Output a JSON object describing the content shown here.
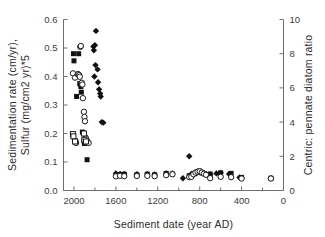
{
  "chart_data": {
    "type": "scatter",
    "title": "",
    "xlabel": "Sediment date (year AD)",
    "ylabel_left": "Sedimentation rate (cm/yr),\nSulfur (mg/cm2 yr)*5",
    "ylabel_left_line1": "Sedimentation rate (cm/yr),",
    "ylabel_left_line2_a": "Sulfur (mg/cm",
    "ylabel_left_line2_sup": "2",
    "ylabel_left_line2_b": " yr)*5",
    "ylabel_right": "Centric: pennate diatom ratio",
    "xlim": [
      2100,
      0
    ],
    "x_reversed": true,
    "ylim_left": [
      0.0,
      0.6
    ],
    "ylim_right": [
      0,
      10
    ],
    "grid": false,
    "legend_position": "none",
    "xticks": [
      2000,
      1600,
      1200,
      800,
      400,
      0
    ],
    "xticklabels": [
      "2000",
      "1600",
      "1200",
      "800",
      "400",
      "0"
    ],
    "xminorticks": [
      1800,
      1400,
      1000,
      600,
      200
    ],
    "yticks_left": [
      0.0,
      0.1,
      0.2,
      0.3,
      0.4,
      0.5,
      0.6
    ],
    "yticklabels_left": [
      "0.0",
      "0.1",
      "0.2",
      "0.3",
      "0.4",
      "0.5",
      "0.6"
    ],
    "yticks_right": [
      0,
      2,
      4,
      6,
      8,
      10
    ],
    "yticklabels_right": [
      "0",
      "2",
      "4",
      "6",
      "8",
      "10"
    ],
    "series": [
      {
        "name": "Sedimentation rate",
        "marker": "filled-square",
        "color": "#111111",
        "axis": "left",
        "points": [
          [
            2005,
            0.48
          ],
          [
            2000,
            0.455
          ],
          [
            1975,
            0.33
          ],
          [
            1955,
            0.48
          ],
          [
            1945,
            0.375
          ],
          [
            1935,
            0.365
          ],
          [
            1930,
            0.345
          ],
          [
            1920,
            0.205
          ],
          [
            1905,
            0.175
          ],
          [
            1900,
            0.165
          ],
          [
            1890,
            0.185
          ],
          [
            1875,
            0.108
          ],
          [
            1560,
            0.056
          ],
          [
            1520,
            0.057
          ],
          [
            1400,
            0.055
          ],
          [
            1300,
            0.057
          ],
          [
            1230,
            0.055
          ],
          [
            1120,
            0.06
          ],
          [
            1060,
            0.058
          ],
          [
            900,
            0.052
          ],
          [
            870,
            0.055
          ],
          [
            840,
            0.063
          ],
          [
            820,
            0.066
          ],
          [
            800,
            0.068
          ],
          [
            780,
            0.062
          ],
          [
            740,
            0.056
          ],
          [
            700,
            0.058
          ],
          [
            600,
            0.062
          ],
          [
            500,
            0.06
          ],
          [
            400,
            0.046
          ],
          [
            120,
            0.043
          ]
        ]
      },
      {
        "name": "Sulfur (mg/cm2 yr)*5",
        "marker": "filled-diamond",
        "color": "#111111",
        "axis": "left",
        "points": [
          [
            1790,
            0.56
          ],
          [
            1800,
            0.51
          ],
          [
            1815,
            0.505
          ],
          [
            1810,
            0.492
          ],
          [
            1795,
            0.44
          ],
          [
            1805,
            0.4
          ],
          [
            1775,
            0.425
          ],
          [
            1770,
            0.38
          ],
          [
            1760,
            0.355
          ],
          [
            1750,
            0.34
          ],
          [
            1745,
            0.33
          ],
          [
            1735,
            0.24
          ],
          [
            1720,
            0.238
          ],
          [
            1600,
            0.06
          ],
          [
            1560,
            0.058
          ],
          [
            1520,
            0.058
          ],
          [
            1400,
            0.057
          ],
          [
            1300,
            0.058
          ],
          [
            1230,
            0.056
          ],
          [
            1120,
            0.06
          ],
          [
            1060,
            0.06
          ],
          [
            960,
            0.043
          ],
          [
            900,
            0.12
          ],
          [
            880,
            0.058
          ],
          [
            860,
            0.06
          ],
          [
            830,
            0.06
          ],
          [
            800,
            0.066
          ],
          [
            780,
            0.064
          ],
          [
            760,
            0.062
          ],
          [
            740,
            0.058
          ],
          [
            700,
            0.056
          ],
          [
            640,
            0.06
          ],
          [
            600,
            0.062
          ],
          [
            520,
            0.058
          ],
          [
            420,
            0.046
          ],
          [
            400,
            0.044
          ],
          [
            120,
            0.043
          ]
        ]
      },
      {
        "name": "Centric: pennate diatom ratio",
        "marker": "open-circle",
        "color": "#ffffff",
        "edge": "#1a1a1a",
        "axis": "right",
        "points": [
          [
            2010,
            6.85
          ],
          [
            1990,
            6.6
          ],
          [
            1985,
            2.88
          ],
          [
            1980,
            2.78
          ],
          [
            1965,
            6.8
          ],
          [
            1960,
            6.8
          ],
          [
            1950,
            6.75
          ],
          [
            1945,
            6.65
          ],
          [
            1940,
            8.4
          ],
          [
            1935,
            8.45
          ],
          [
            1925,
            6.3
          ],
          [
            1920,
            6.2
          ],
          [
            1915,
            5.4
          ],
          [
            1905,
            4.6
          ],
          [
            1900,
            4.3
          ],
          [
            1895,
            4.05
          ],
          [
            1885,
            3.05
          ],
          [
            1880,
            2.8
          ],
          [
            1870,
            2.85
          ],
          [
            1860,
            2.78
          ],
          [
            1600,
            0.83
          ],
          [
            1560,
            0.86
          ],
          [
            1520,
            0.84
          ],
          [
            1400,
            0.85
          ],
          [
            1300,
            0.86
          ],
          [
            1230,
            0.84
          ],
          [
            1120,
            0.9
          ],
          [
            1060,
            0.95
          ],
          [
            900,
            0.78
          ],
          [
            880,
            0.8
          ],
          [
            860,
            0.95
          ],
          [
            840,
            1.05
          ],
          [
            820,
            1.1
          ],
          [
            800,
            1.12
          ],
          [
            780,
            1.05
          ],
          [
            760,
            0.98
          ],
          [
            740,
            0.92
          ],
          [
            700,
            0.72
          ],
          [
            600,
            0.8
          ],
          [
            500,
            0.78
          ],
          [
            400,
            0.7
          ],
          [
            120,
            0.7
          ]
        ]
      },
      {
        "name": "Open square markers",
        "marker": "open-square",
        "color": "#ffffff",
        "edge": "#1a1a1a",
        "axis": "left",
        "points": [
          [
            2010,
            0.198
          ],
          [
            2005,
            0.19
          ],
          [
            1990,
            0.172
          ],
          [
            1905,
            0.2
          ],
          [
            1900,
            0.178
          ],
          [
            1885,
            0.172
          ]
        ]
      }
    ]
  }
}
